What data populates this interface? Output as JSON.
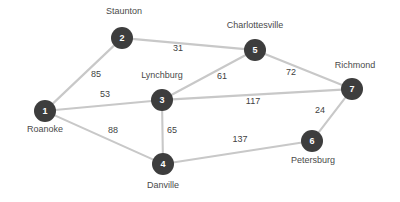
{
  "diagram": {
    "type": "weighted-undirected-graph",
    "title": "",
    "style": {
      "node_fill": "#3d3d3d",
      "node_text": "#ffffff",
      "edge_color": "#c8c8c8",
      "label_color": "#4a4a4a",
      "background": "#ffffff"
    },
    "nodes": [
      {
        "id": "1",
        "label": "Roanoke",
        "x": 45,
        "y": 111,
        "r": 11,
        "label_x": 45,
        "label_y": 124
      },
      {
        "id": "2",
        "label": "Staunton",
        "x": 122,
        "y": 38,
        "r": 11,
        "label_x": 124,
        "label_y": 6
      },
      {
        "id": "3",
        "label": "Lynchburg",
        "x": 162,
        "y": 100,
        "r": 11,
        "label_x": 162,
        "label_y": 70
      },
      {
        "id": "4",
        "label": "Danville",
        "x": 163,
        "y": 164,
        "r": 11,
        "label_x": 163,
        "label_y": 180
      },
      {
        "id": "5",
        "label": "Charlottesville",
        "x": 255,
        "y": 50,
        "r": 11,
        "label_x": 255,
        "label_y": 20
      },
      {
        "id": "6",
        "label": "Petersburg",
        "x": 312,
        "y": 141,
        "r": 11,
        "label_x": 313,
        "label_y": 155
      },
      {
        "id": "7",
        "label": "Richmond",
        "x": 352,
        "y": 89,
        "r": 11,
        "label_x": 355,
        "label_y": 60
      }
    ],
    "edges": [
      {
        "from": "1",
        "to": "2",
        "weight": "85",
        "label_x": 96,
        "label_y": 74
      },
      {
        "from": "1",
        "to": "3",
        "weight": "53",
        "label_x": 105,
        "label_y": 94
      },
      {
        "from": "1",
        "to": "4",
        "weight": "88",
        "label_x": 113,
        "label_y": 130
      },
      {
        "from": "2",
        "to": "5",
        "weight": "31",
        "label_x": 178,
        "label_y": 48
      },
      {
        "from": "3",
        "to": "5",
        "weight": "61",
        "label_x": 222,
        "label_y": 76
      },
      {
        "from": "3",
        "to": "7",
        "weight": "117",
        "label_x": 253,
        "label_y": 101
      },
      {
        "from": "3",
        "to": "4",
        "weight": "65",
        "label_x": 172,
        "label_y": 130
      },
      {
        "from": "5",
        "to": "7",
        "weight": "72",
        "label_x": 291,
        "label_y": 72
      },
      {
        "from": "6",
        "to": "7",
        "weight": "24",
        "label_x": 320,
        "label_y": 110
      },
      {
        "from": "4",
        "to": "6",
        "weight": "137",
        "label_x": 240,
        "label_y": 139
      }
    ]
  }
}
